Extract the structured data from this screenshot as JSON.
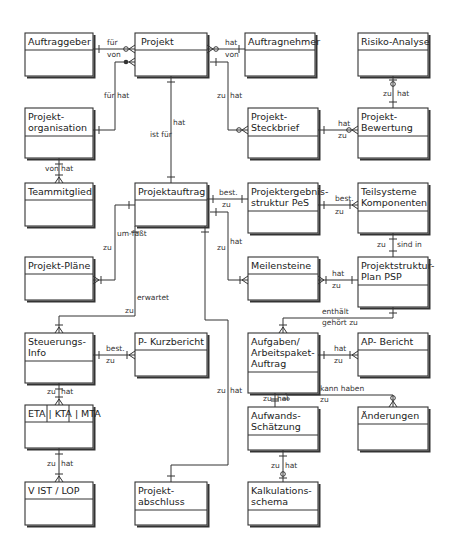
{
  "diagram": {
    "title": "",
    "entities": [
      {
        "id": "auftraggeber",
        "lines": [
          "Auftraggeber"
        ]
      },
      {
        "id": "projekt",
        "lines": [
          "Projekt"
        ]
      },
      {
        "id": "auftragnehmer",
        "lines": [
          "Auftragnehmer"
        ]
      },
      {
        "id": "risiko",
        "lines": [
          "Risiko-Analyse"
        ]
      },
      {
        "id": "projorg",
        "lines": [
          "Projekt-",
          "organisation"
        ]
      },
      {
        "id": "steckbrief",
        "lines": [
          "Projekt-",
          "Steckbrief"
        ]
      },
      {
        "id": "bewertung",
        "lines": [
          "Projekt-",
          "Bewertung"
        ]
      },
      {
        "id": "teammitglied",
        "lines": [
          "Teammitglied"
        ]
      },
      {
        "id": "projektauftrag",
        "lines": [
          "Projektauftrag"
        ]
      },
      {
        "id": "pes",
        "lines": [
          "Projektergebnis-",
          "struktur PeS"
        ]
      },
      {
        "id": "teilsysteme",
        "lines": [
          "Teilsysteme",
          "Komponenten"
        ]
      },
      {
        "id": "plaene",
        "lines": [
          "Projekt-Pläne"
        ]
      },
      {
        "id": "meilensteine",
        "lines": [
          "Meilensteine"
        ]
      },
      {
        "id": "psp",
        "lines": [
          "Projektstruktur-",
          "Plan  PSP"
        ]
      },
      {
        "id": "steuerung",
        "lines": [
          "Steuerungs-",
          "Info"
        ]
      },
      {
        "id": "kurzbericht",
        "lines": [
          "P- Kurzbericht"
        ]
      },
      {
        "id": "aufgaben",
        "lines": [
          "Aufgaben/",
          "Arbeitspaket-",
          "Auftrag"
        ]
      },
      {
        "id": "apbericht",
        "lines": [
          "AP- Bericht"
        ]
      },
      {
        "id": "eta",
        "lines": [
          "ETA | KTA | MTA"
        ]
      },
      {
        "id": "aufwand",
        "lines": [
          "Aufwands-",
          "Schätzung"
        ]
      },
      {
        "id": "aenderungen",
        "lines": [
          "Änderungen"
        ]
      },
      {
        "id": "vist",
        "lines": [
          "V IST  /  LOP"
        ]
      },
      {
        "id": "abschluss",
        "lines": [
          "Projekt-",
          "abschluss"
        ]
      },
      {
        "id": "kalkulation",
        "lines": [
          "Kalkulations-",
          "schema"
        ]
      }
    ],
    "relationships": [
      {
        "id": "r-auftraggeber-projekt",
        "from": "auftraggeber",
        "to": "projekt",
        "labels": [
          "für",
          "von"
        ]
      },
      {
        "id": "r-projekt-auftragnehmer",
        "from": "projekt",
        "to": "auftragnehmer",
        "labels": [
          "hat",
          "von"
        ]
      },
      {
        "id": "r-projorg-projekt",
        "from": "projorg",
        "to": "projekt",
        "labels": [
          "für",
          "hat"
        ]
      },
      {
        "id": "r-projekt-steckbrief",
        "from": "projekt",
        "to": "steckbrief",
        "labels": [
          "zu",
          "hat"
        ]
      },
      {
        "id": "r-risiko-bewertung",
        "from": "risiko",
        "to": "bewertung",
        "labels": [
          "zu",
          "hat"
        ]
      },
      {
        "id": "r-steckbrief-bewertung",
        "from": "steckbrief",
        "to": "bewertung",
        "labels": [
          "hat",
          "zu"
        ]
      },
      {
        "id": "r-projorg-team",
        "from": "projorg",
        "to": "teammitglied",
        "labels": [
          "von",
          "hat"
        ]
      },
      {
        "id": "r-projekt-projektauftrag",
        "from": "projekt",
        "to": "projektauftrag",
        "labels": [
          "hat",
          "ist für"
        ]
      },
      {
        "id": "r-auftrag-pes",
        "from": "projektauftrag",
        "to": "pes",
        "labels": [
          "best.",
          "zu"
        ]
      },
      {
        "id": "r-pes-teilsysteme",
        "from": "pes",
        "to": "teilsysteme",
        "labels": [
          "best.",
          "zu"
        ]
      },
      {
        "id": "r-auftrag-plaene",
        "from": "projektauftrag",
        "to": "plaene",
        "labels": [
          "um-faßt",
          "zu"
        ]
      },
      {
        "id": "r-auftrag-meilensteine",
        "from": "projektauftrag",
        "to": "meilensteine",
        "labels": [
          "hat",
          "zu"
        ]
      },
      {
        "id": "r-teilsysteme-psp",
        "from": "teilsysteme",
        "to": "psp",
        "labels": [
          "zu",
          "sind in"
        ]
      },
      {
        "id": "r-meilensteine-psp",
        "from": "meilensteine",
        "to": "psp",
        "labels": [
          "hat",
          "zu"
        ]
      },
      {
        "id": "r-auftrag-steuerung",
        "from": "projektauftrag",
        "to": "steuerung",
        "labels": [
          "erwartet",
          "zu"
        ]
      },
      {
        "id": "r-psp-aufgaben",
        "from": "psp",
        "to": "aufgaben",
        "labels": [
          "enthält",
          "gehört zu"
        ]
      },
      {
        "id": "r-steuerung-kurzbericht",
        "from": "steuerung",
        "to": "kurzbericht",
        "labels": [
          "best.",
          "zu"
        ]
      },
      {
        "id": "r-aufgaben-apbericht",
        "from": "aufgaben",
        "to": "apbericht",
        "labels": [
          "hat",
          "zu"
        ]
      },
      {
        "id": "r-steuerung-eta",
        "from": "steuerung",
        "to": "eta",
        "labels": [
          "zu",
          "hat"
        ]
      },
      {
        "id": "r-aufgaben-aufwand",
        "from": "aufgaben",
        "to": "aufwand",
        "labels": [
          "zu",
          "hat"
        ]
      },
      {
        "id": "r-aufgaben-aenderungen",
        "from": "aufgaben",
        "to": "aenderungen",
        "labels": [
          "kann haben",
          "zu"
        ]
      },
      {
        "id": "r-auftrag-abschluss",
        "from": "projektauftrag",
        "to": "abschluss",
        "labels": [
          "zu",
          "hat"
        ]
      },
      {
        "id": "r-eta-vist",
        "from": "eta",
        "to": "vist",
        "labels": [
          "zu",
          "hat"
        ]
      },
      {
        "id": "r-aufwand-kalkulation",
        "from": "aufwand",
        "to": "kalkulation",
        "labels": [
          "zu",
          "hat"
        ]
      }
    ]
  }
}
